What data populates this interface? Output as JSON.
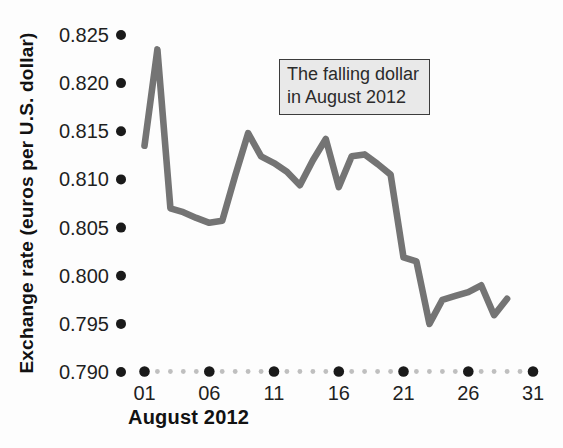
{
  "chart_data": {
    "type": "line",
    "xlabel": "August 2012",
    "ylabel": "Exchange rate (euros per U.S. dollar)",
    "annotation": {
      "line1": "The falling dollar",
      "line2": "in August 2012"
    },
    "x_days": [
      1,
      2,
      3,
      4,
      5,
      6,
      7,
      8,
      9,
      10,
      11,
      12,
      13,
      14,
      15,
      16,
      17,
      18,
      19,
      20,
      21,
      22,
      23,
      24,
      25,
      26,
      27,
      28,
      29
    ],
    "values": [
      0.8135,
      0.8235,
      0.807,
      0.8066,
      0.806,
      0.8055,
      0.8057,
      0.8104,
      0.8148,
      0.8124,
      0.8117,
      0.8108,
      0.8094,
      0.812,
      0.8142,
      0.8092,
      0.8124,
      0.8126,
      0.8116,
      0.8105,
      0.8019,
      0.8015,
      0.795,
      0.7975,
      0.7979,
      0.7983,
      0.799,
      0.7959,
      0.7976
    ],
    "xlim": [
      1,
      31
    ],
    "ylim": [
      0.79,
      0.825
    ],
    "x_major_ticks": [
      1,
      6,
      11,
      16,
      21,
      26,
      31
    ],
    "x_major_tick_labels": [
      "01",
      "06",
      "11",
      "16",
      "21",
      "26",
      "31"
    ],
    "y_ticks": [
      {
        "value": 0.825,
        "label": "0.825"
      },
      {
        "value": 0.82,
        "label": "0.820"
      },
      {
        "value": 0.815,
        "label": "0.815"
      },
      {
        "value": 0.81,
        "label": "0.810"
      },
      {
        "value": 0.805,
        "label": "0.805"
      },
      {
        "value": 0.8,
        "label": "0.800"
      },
      {
        "value": 0.795,
        "label": "0.795"
      },
      {
        "value": 0.79,
        "label": "0.790"
      }
    ],
    "grid": "none",
    "legend": "none",
    "colors": {
      "line": "#747474",
      "major_dot": "#1a1a1a",
      "minor_dot": "#bfbfbf",
      "text": "#1f1f1f",
      "annotation_bg": "#e9e9e9",
      "annotation_border": "#3c3c3c",
      "background": "#fdfdfd"
    }
  }
}
